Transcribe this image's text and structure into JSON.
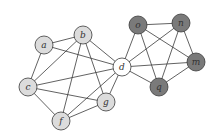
{
  "diagram": {
    "type": "graph",
    "nodes": [
      {
        "id": "a",
        "label": "a",
        "x": 44,
        "y": 45,
        "group": "light"
      },
      {
        "id": "b",
        "label": "b",
        "x": 83,
        "y": 35,
        "group": "light"
      },
      {
        "id": "c",
        "label": "c",
        "x": 28,
        "y": 87,
        "group": "light"
      },
      {
        "id": "f",
        "label": "f",
        "x": 61,
        "y": 121,
        "group": "light"
      },
      {
        "id": "g",
        "label": "g",
        "x": 106,
        "y": 102,
        "group": "light"
      },
      {
        "id": "d",
        "label": "d",
        "x": 122,
        "y": 67,
        "group": "bridge"
      },
      {
        "id": "o",
        "label": "o",
        "x": 138,
        "y": 25,
        "group": "dark"
      },
      {
        "id": "n",
        "label": "n",
        "x": 181,
        "y": 23,
        "group": "dark"
      },
      {
        "id": "m",
        "label": "m",
        "x": 196,
        "y": 62,
        "group": "dark"
      },
      {
        "id": "q",
        "label": "q",
        "x": 159,
        "y": 87,
        "group": "dark"
      }
    ],
    "edges": [
      [
        "a",
        "b"
      ],
      [
        "a",
        "c"
      ],
      [
        "a",
        "d"
      ],
      [
        "b",
        "c"
      ],
      [
        "b",
        "f"
      ],
      [
        "b",
        "g"
      ],
      [
        "b",
        "d"
      ],
      [
        "c",
        "d"
      ],
      [
        "c",
        "g"
      ],
      [
        "c",
        "f"
      ],
      [
        "f",
        "g"
      ],
      [
        "f",
        "d"
      ],
      [
        "g",
        "d"
      ],
      [
        "o",
        "n"
      ],
      [
        "o",
        "m"
      ],
      [
        "o",
        "q"
      ],
      [
        "o",
        "d"
      ],
      [
        "n",
        "m"
      ],
      [
        "n",
        "q"
      ],
      [
        "n",
        "d"
      ],
      [
        "m",
        "q"
      ],
      [
        "m",
        "d"
      ],
      [
        "q",
        "d"
      ]
    ],
    "colors": {
      "light": "#dcdcdc",
      "dark": "#7a7a7a",
      "bridge": "#ffffff",
      "stroke": "#3a3a3a"
    },
    "node_radius": 9
  }
}
